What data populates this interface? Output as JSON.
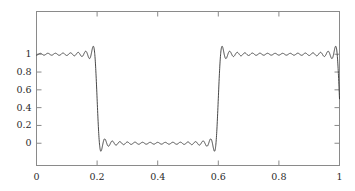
{
  "figure": {
    "background_color": "#ffffff",
    "frame_color": "#8a8a8a",
    "curve_color": "#333333",
    "tick_label_color": "#2b2b2b"
  },
  "chart_data": {
    "type": "line",
    "title": "",
    "subtitle": "",
    "xlabel": "",
    "ylabel": "",
    "grid": false,
    "legend": null,
    "annotations": [],
    "xlim": [
      0,
      1
    ],
    "ylim": [
      -0.25,
      1.48
    ],
    "xticks": [
      0,
      0.2,
      0.4,
      0.6,
      0.8,
      1
    ],
    "xtick_labels": [
      "0",
      "0.2",
      "0.4",
      "0.6",
      "0.8",
      "1"
    ],
    "yticks": [
      0,
      0.2,
      0.4,
      0.6,
      0.8,
      1
    ],
    "ytick_labels": [
      "0",
      "0.2",
      "0.4",
      "0.6",
      "0.8",
      "1"
    ],
    "series": [
      {
        "name": "Fourier partial sum",
        "jump_location": 0.6,
        "step_low": 0,
        "step_high": 1,
        "harmonics": 31,
        "overshoot_max": 1.14,
        "undershoot_min": -0.14,
        "x": [
          0.0,
          0.005,
          0.01,
          0.015,
          0.02,
          0.025,
          0.03,
          0.035,
          0.04,
          0.045,
          0.05,
          0.055,
          0.06,
          0.065,
          0.07,
          0.075,
          0.08,
          0.085,
          0.09,
          0.095,
          0.1,
          0.105,
          0.11,
          0.115,
          0.12,
          0.125,
          0.13,
          0.135,
          0.14,
          0.145,
          0.15,
          0.155,
          0.16,
          0.165,
          0.17,
          0.175,
          0.18,
          0.185,
          0.19,
          0.195,
          0.2,
          0.205,
          0.21,
          0.215,
          0.22,
          0.225,
          0.23,
          0.235,
          0.24,
          0.245,
          0.25,
          0.255,
          0.26,
          0.265,
          0.27,
          0.275,
          0.28,
          0.285,
          0.29,
          0.295,
          0.3,
          0.305,
          0.31,
          0.315,
          0.32,
          0.325,
          0.33,
          0.335,
          0.34,
          0.345,
          0.35,
          0.355,
          0.36,
          0.365,
          0.37,
          0.375,
          0.38,
          0.385,
          0.39,
          0.395,
          0.4,
          0.405,
          0.41,
          0.415,
          0.42,
          0.425,
          0.43,
          0.435,
          0.44,
          0.445,
          0.45,
          0.455,
          0.46,
          0.465,
          0.47,
          0.475,
          0.48,
          0.485,
          0.49,
          0.495,
          0.5,
          0.505,
          0.51,
          0.515,
          0.52,
          0.525,
          0.53,
          0.535,
          0.54,
          0.545,
          0.55,
          0.555,
          0.56,
          0.565,
          0.57,
          0.575,
          0.58,
          0.585,
          0.59,
          0.595,
          0.6,
          0.605,
          0.61,
          0.615,
          0.62,
          0.625,
          0.63,
          0.635,
          0.64,
          0.645,
          0.65,
          0.655,
          0.66,
          0.665,
          0.67,
          0.675,
          0.68,
          0.685,
          0.69,
          0.695,
          0.7,
          0.705,
          0.71,
          0.715,
          0.72,
          0.725,
          0.73,
          0.735,
          0.74,
          0.745,
          0.75,
          0.755,
          0.76,
          0.765,
          0.77,
          0.775,
          0.78,
          0.785,
          0.79,
          0.795,
          0.8,
          0.805,
          0.81,
          0.815,
          0.82,
          0.825,
          0.83,
          0.835,
          0.84,
          0.845,
          0.85,
          0.855,
          0.86,
          0.865,
          0.87,
          0.875,
          0.88,
          0.885,
          0.89,
          0.895,
          0.9,
          0.905,
          0.91,
          0.915,
          0.92,
          0.925,
          0.93,
          0.935,
          0.94,
          0.945,
          0.95,
          0.955,
          0.96,
          0.965,
          0.97,
          0.975,
          0.98,
          0.985,
          0.99,
          0.995,
          1.0
        ]
      }
    ]
  }
}
